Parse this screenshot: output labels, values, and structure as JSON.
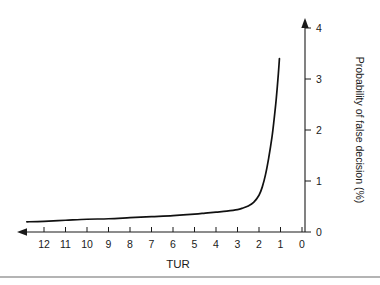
{
  "chart_data": {
    "type": "line",
    "title": "",
    "subtitle": "",
    "xlabel": "TUR",
    "ylabel": "Probability of false decision (%)",
    "x_tick_labels": [
      "12",
      "11",
      "10",
      "9",
      "8",
      "7",
      "6",
      "5",
      "4",
      "3",
      "2",
      "1",
      "0"
    ],
    "y_tick_labels": [
      "0",
      "1",
      "2",
      "3",
      "4"
    ],
    "xlim": [
      0,
      13
    ],
    "ylim": [
      0,
      4
    ],
    "x_axis_direction": "right-to-left",
    "x_axis_position": "bottom",
    "y_axis_position": "right",
    "grid": false,
    "legend": null,
    "x_arrow": "left",
    "y_arrow": "up",
    "series": [
      {
        "name": "Probability of false decision",
        "x": [
          12.8,
          12.0,
          11.0,
          10.0,
          9.0,
          8.0,
          7.0,
          6.0,
          5.0,
          4.5,
          4.0,
          3.5,
          3.0,
          2.75,
          2.5,
          2.25,
          2.0,
          1.85,
          1.7,
          1.55,
          1.4,
          1.3,
          1.2,
          1.1,
          1.05
        ],
        "y": [
          0.2,
          0.21,
          0.23,
          0.25,
          0.26,
          0.28,
          0.3,
          0.32,
          0.35,
          0.37,
          0.39,
          0.41,
          0.44,
          0.47,
          0.51,
          0.58,
          0.72,
          0.88,
          1.12,
          1.45,
          1.85,
          2.2,
          2.6,
          3.1,
          3.4
        ]
      }
    ],
    "annotations": []
  },
  "figure": {
    "caption_rule": true,
    "background_color": "#ffffff",
    "line_color": "#111111",
    "axis_color": "#1a1a1a"
  }
}
